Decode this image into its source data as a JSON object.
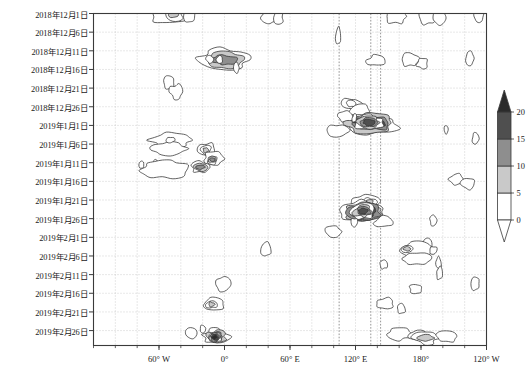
{
  "figure": {
    "kind": "hovmoller-contour-diagram",
    "background_color": "#ffffff",
    "frame_color": "#3a3a3a",
    "gridline_color": "#b9b9b9"
  },
  "chart_data": {
    "type": "heatmap",
    "title": "",
    "subtitle": "",
    "xlabel": "",
    "ylabel": "",
    "grid": true,
    "legend_position": "right",
    "xlim": [
      -120,
      240
    ],
    "ylim_dates": [
      "2018-12-01",
      "2019-02-28"
    ],
    "x_tick_values": [
      -60,
      0,
      60,
      120,
      180,
      240
    ],
    "x_tick_labels": [
      "60° W",
      "0°",
      "60° E",
      "120° E",
      "180°",
      "120° W"
    ],
    "y_tick_labels": [
      "2018年12月1日",
      "2018年12月6日",
      "2018年12月11日",
      "2018年12月16日",
      "2018年12月21日",
      "2018年12月26日",
      "2019年1月1日",
      "2019年1月6日",
      "2019年1月11日",
      "2019年1月16日",
      "2019年1月21日",
      "2019年1月26日",
      "2019年2月1日",
      "2019年2月6日",
      "2019年2月11日",
      "2019年2月16日",
      "2019年2月21日",
      "2019年2月26日"
    ],
    "contour_levels": [
      0,
      5,
      10,
      15,
      20
    ],
    "level_colors": [
      "#ffffff",
      "#ffffff",
      "#c9c9c9",
      "#8e8e8e",
      "#4f4f4f",
      "#2b2b2b"
    ],
    "units": "",
    "features": [
      {
        "label": "2018-12-01 Atlantic band",
        "x_center": -50,
        "y_label": "2018年12月1日",
        "peak": 12
      },
      {
        "label": "2018-12-01 Indian band",
        "x_center": 45,
        "y_label": "2018年12月1日",
        "peak": 6
      },
      {
        "label": "2018-12-01 Pacific band",
        "x_center": 185,
        "y_label": "2018年12月1日",
        "peak": 6
      },
      {
        "label": "2018-12-13 Atlantic max",
        "x_center": 0,
        "y_label": "2018年12月11日",
        "peak": 17
      },
      {
        "label": "2018-12-19 small cells",
        "x_center": -40,
        "y_label": "2018年12月21日",
        "peak": 6
      },
      {
        "label": "2018-12-26 Pacific cells",
        "x_center": 150,
        "y_label": "2018年12月26日",
        "peak": 8
      },
      {
        "label": "2019-01-02 west Pacific max",
        "x_center": 140,
        "y_label": "2019年1月1日",
        "peak": 23
      },
      {
        "label": "2019-01-06 Atlantic cells",
        "x_center": -35,
        "y_label": "2019年1月6日",
        "peak": 12
      },
      {
        "label": "2019-01-11 Atlantic max",
        "x_center": -5,
        "y_label": "2019年1月11日",
        "peak": 16
      },
      {
        "label": "2019-01-24 dateline max",
        "x_center": 150,
        "y_label": "2019年1月26日",
        "peak": 24
      },
      {
        "label": "2019-02-01 Pacific cells",
        "x_center": 130,
        "y_label": "2019年2月1日",
        "peak": 15
      },
      {
        "label": "2019-02-06 east Pacific",
        "x_center": 195,
        "y_label": "2019年2月6日",
        "peak": 11
      },
      {
        "label": "2019-02-18 Atlantic cell",
        "x_center": -12,
        "y_label": "2019年2月16日",
        "peak": 11
      },
      {
        "label": "2019-02-25 Atlantic max",
        "x_center": -8,
        "y_label": "2019年2月26日",
        "peak": 22
      },
      {
        "label": "2019-02-25 Pacific band",
        "x_center": 185,
        "y_label": "2019年2月26日",
        "peak": 11
      }
    ],
    "vertical_reference_lines_x": [
      105,
      134,
      143
    ]
  },
  "colorbar": {
    "orientation": "vertical",
    "tick_labels": [
      "0",
      "5",
      "10",
      "15",
      "20"
    ],
    "extend": "both",
    "swatch_colors": [
      "#ffffff",
      "#c9c9c9",
      "#8e8e8e",
      "#4f4f4f"
    ],
    "over_color": "#2b2b2b",
    "under_color": "#ffffff",
    "outline_color": "#3a3a3a"
  }
}
